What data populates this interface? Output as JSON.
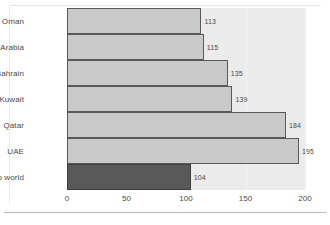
{
  "chart_data": {
    "type": "bar",
    "orientation": "horizontal",
    "title": "",
    "xlabel": "",
    "ylabel": "",
    "categories": [
      "Oman",
      "Saudi Arabia",
      "Bahrain",
      "Kuwait",
      "Qatar",
      "UAE",
      "Arab world"
    ],
    "values": [
      113,
      115,
      135,
      139,
      184,
      195,
      104
    ],
    "value_labels": [
      "113",
      "115",
      "135",
      "139",
      "184",
      "195",
      "104"
    ],
    "xlim": [
      0,
      200
    ],
    "xticks": [
      0,
      50,
      100,
      150,
      200
    ],
    "xtick_labels": [
      "0",
      "50",
      "100",
      "150",
      "200"
    ],
    "grid": true,
    "legend": "none",
    "highlight_category": "Arab world",
    "colors": {
      "bar_fill": "#c9c9c9",
      "bar_border": "#595959",
      "highlight_fill": "#595959",
      "highlight_border": "#3d3d3d",
      "plot_background": "#ebebeb",
      "gridline": "#f4f4f4",
      "text": "#4a4a4a",
      "figure_background": "#ffffff"
    }
  }
}
